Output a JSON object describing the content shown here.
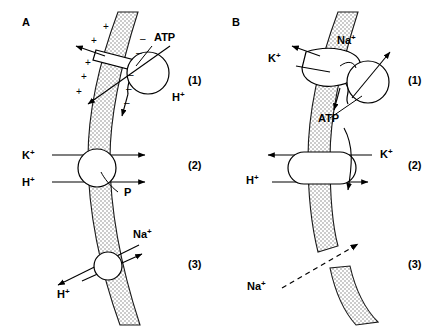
{
  "figure": {
    "width": 441,
    "height": 334,
    "background": "#ffffff",
    "ink_color": "#000000",
    "membrane_fill": "#d9d9d9"
  },
  "panels": [
    {
      "id": "A",
      "label": "A",
      "label_x": 22,
      "label_y": 26,
      "steps": [
        {
          "id": "A1",
          "marker": "(1)",
          "marker_x": 188,
          "marker_y": 84,
          "description": "proton-translocating ATPase with membrane sector and catalytic head",
          "labels": [
            {
              "text": "ATP",
              "sup": "",
              "x": 154,
              "y": 41
            },
            {
              "text": "H",
              "sup": "+",
              "x": 172,
              "y": 101
            }
          ],
          "charges_outside": "+",
          "charges_inside": "-"
        },
        {
          "id": "A2",
          "marker": "(2)",
          "marker_x": 188,
          "marker_y": 169,
          "description": "carrier circle passing K+ and H+ outward, phosphorylated intermediate",
          "labels": [
            {
              "text": "K",
              "sup": "+",
              "x": 22,
              "y": 159
            },
            {
              "text": "H",
              "sup": "+",
              "x": 22,
              "y": 186
            },
            {
              "text": "P",
              "sup": "",
              "x": 124,
              "y": 196
            }
          ]
        },
        {
          "id": "A3",
          "marker": "(3)",
          "marker_x": 188,
          "marker_y": 268,
          "description": "Na+/H+ antiporter circle exchanging sodium inward for protons outward",
          "labels": [
            {
              "text": "Na",
              "sup": "+",
              "x": 133,
              "y": 238
            },
            {
              "text": "H",
              "sup": "+",
              "x": 57,
              "y": 298
            }
          ]
        }
      ]
    },
    {
      "id": "B",
      "label": "B",
      "label_x": 232,
      "label_y": 26,
      "steps": [
        {
          "id": "B1",
          "marker": "(1)",
          "marker_x": 408,
          "marker_y": 84,
          "description": "Na+/K+ ATPase with membrane sector and catalytic head driven by ATP",
          "labels": [
            {
              "text": "K",
              "sup": "+",
              "x": 268,
              "y": 62
            },
            {
              "text": "Na",
              "sup": "+",
              "x": 337,
              "y": 44
            },
            {
              "text": "ATP",
              "sup": "",
              "x": 318,
              "y": 122
            }
          ]
        },
        {
          "id": "B2",
          "marker": "(2)",
          "marker_x": 408,
          "marker_y": 169,
          "description": "capsule-shaped carrier exchanging K+ inward and H+ outward",
          "labels": [
            {
              "text": "K",
              "sup": "+",
              "x": 380,
              "y": 158
            },
            {
              "text": "H",
              "sup": "+",
              "x": 246,
              "y": 184
            }
          ]
        },
        {
          "id": "B3",
          "marker": "(3)",
          "marker_x": 408,
          "marker_y": 268,
          "description": "paracellular leak of Na+ through a break in the membrane, dashed arrow",
          "labels": [
            {
              "text": "Na",
              "sup": "+",
              "x": 247,
              "y": 290
            }
          ]
        }
      ]
    }
  ],
  "charge_marks": {
    "plus": "+",
    "minus": "–",
    "plus_positions": [
      [
        103,
        30
      ],
      [
        91,
        44
      ],
      [
        85,
        66
      ],
      [
        81,
        80
      ],
      [
        76,
        95
      ]
    ],
    "minus_positions": [
      [
        140,
        42
      ],
      [
        136,
        56
      ],
      [
        128,
        76
      ],
      [
        126,
        90
      ],
      [
        124,
        104
      ]
    ]
  }
}
